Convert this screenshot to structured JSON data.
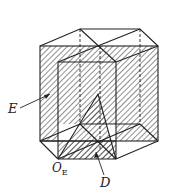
{
  "figure": {
    "labels": {
      "e": "E",
      "oe_main": "O",
      "oe_sub": "E",
      "d": "D"
    },
    "colors": {
      "line": "#222222",
      "hatch": "#333333",
      "background": "#ffffff"
    }
  }
}
